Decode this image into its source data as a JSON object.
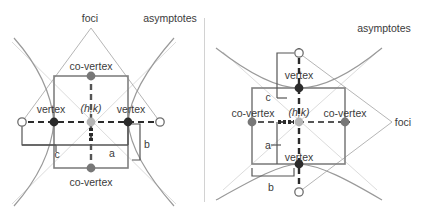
{
  "figure": {
    "colors": {
      "text": "#3b3b3b",
      "box_stroke": "#808080",
      "curve_stroke": "#9a9a9a",
      "asymptote_stroke": "#d8d8d8",
      "dashed_axis": "#2b2b2b",
      "vertex_fill": "#2b2b2b",
      "covertex_fill": "#777777",
      "center_fill": "#b5b5b5",
      "focus_fill": "#ffffff",
      "bracket_stroke": "#555555",
      "divider": "#d2d2d2"
    }
  },
  "left_diagram": {
    "name": "horizontal-transverse-hyperbola",
    "labels": {
      "foci": "foci",
      "asymptotes": "asymptotes",
      "co_vertex_top": "co-vertex",
      "co_vertex_bottom": "co-vertex",
      "vertex_left": "vertex",
      "vertex_right": "vertex",
      "center": "(h,k)",
      "a": "a",
      "b": "b",
      "c": "c"
    },
    "geometry": {
      "center": [
        91,
        122
      ],
      "box": {
        "x": 54,
        "y": 76,
        "width": 74,
        "height": 92
      },
      "vertex_left": [
        54,
        122
      ],
      "vertex_right": [
        128,
        122
      ],
      "co_vertex_top": [
        91,
        76
      ],
      "co_vertex_bottom": [
        91,
        168
      ],
      "focus_left": [
        22,
        122
      ],
      "focus_right": [
        160,
        122
      ],
      "a_value": "a",
      "b_value": "b",
      "c_value": "c"
    }
  },
  "right_diagram": {
    "name": "vertical-transverse-hyperbola",
    "labels": {
      "foci": "foci",
      "asymptotes": "asymptotes",
      "vertex_top": "vertex",
      "vertex_bottom": "vertex",
      "co_vertex_left": "co-vertex",
      "co_vertex_right": "co-vertex",
      "center": "(h,k)",
      "a": "a",
      "b": "b",
      "c": "c"
    },
    "geometry": {
      "center": [
        299,
        122
      ],
      "box": {
        "x": 252,
        "y": 88,
        "width": 93,
        "height": 76
      },
      "vertex_top": [
        299,
        88
      ],
      "vertex_bottom": [
        299,
        164
      ],
      "co_vertex_left": [
        252,
        122
      ],
      "co_vertex_right": [
        345,
        122
      ],
      "focus_top": [
        299,
        53
      ],
      "focus_bottom": [
        299,
        192
      ],
      "a_value": "a",
      "b_value": "b",
      "c_value": "c"
    }
  }
}
